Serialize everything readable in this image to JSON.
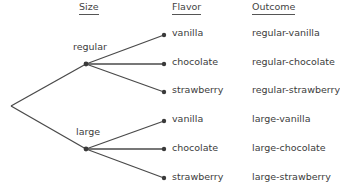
{
  "headers": {
    "size": "Size",
    "flavor": "Flavor",
    "outcome": "Outcome"
  },
  "tree": {
    "branches": [
      {
        "size": "regular",
        "flavors": [
          "vanilla",
          "chocolate",
          "strawberry"
        ],
        "outcomes": [
          "regular-vanilla",
          "regular-chocolate",
          "regular-strawberry"
        ]
      },
      {
        "size": "large",
        "flavors": [
          "vanilla",
          "chocolate",
          "strawberry"
        ],
        "outcomes": [
          "large-vanilla",
          "large-chocolate",
          "large-strawberry"
        ]
      }
    ]
  },
  "colors": {
    "line": "#4a4a4a",
    "dot": "#3a3a3a"
  }
}
